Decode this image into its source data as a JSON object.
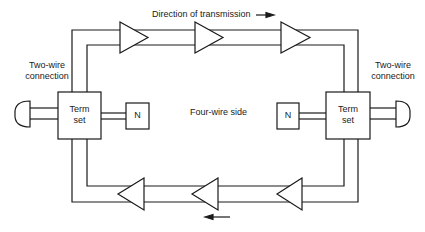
{
  "diagram": {
    "title": "Direction of transmission",
    "center_label": "Four-wire side",
    "left": {
      "connection_label_line1": "Two-wire",
      "connection_label_line2": "connection",
      "term_set_line1": "Term",
      "term_set_line2": "set",
      "network_label": "N"
    },
    "right": {
      "connection_label_line1": "Two-wire",
      "connection_label_line2": "connection",
      "term_set_line1": "Term",
      "term_set_line2": "set",
      "network_label": "N"
    },
    "top_path": {
      "direction": "left-to-right",
      "amplifier_count": 3
    },
    "bottom_path": {
      "direction": "right-to-left",
      "amplifier_count": 3
    },
    "colors": {
      "line": "#1a1a1a",
      "background": "#ffffff"
    }
  }
}
